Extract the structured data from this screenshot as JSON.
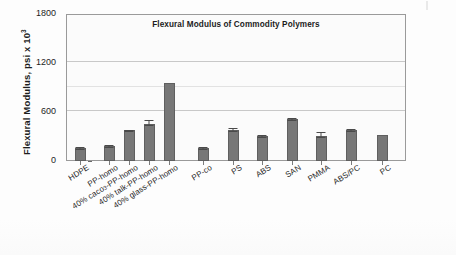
{
  "chart_data": {
    "type": "bar",
    "title": "Flexural Modulus of Commodity Polymers",
    "xlabel": "",
    "ylabel": "Flexural Modulus, psi x 10",
    "ylabel_exponent": "3",
    "ylim": [
      0,
      1800
    ],
    "yticks": [
      0,
      600,
      1200,
      1800
    ],
    "ytick_labels": [
      "0",
      "600",
      "1200",
      "1800"
    ],
    "grid": true,
    "legend": "none",
    "bar_color": "#777777",
    "bar_edge_color": "#5f5f5f",
    "plot_background": "#fbfbfb",
    "categories": [
      "HDPE",
      "PP-homo",
      "40% caco3-PP-homo",
      "40% talk-PP-homo",
      "40% glass-PP-homo",
      "PP-co",
      "PS",
      "ABS",
      "SAN",
      "PMMA",
      "ABS/PC",
      "PC"
    ],
    "category_labels_html": [
      {
        "main": "HDPE",
        "sub": "",
        "tail": ""
      },
      {
        "main": "PP-homo",
        "sub": "",
        "tail": ""
      },
      {
        "main": "40% caco",
        "sub": "3",
        "tail": "-PP-homo"
      },
      {
        "main": "40% talk-PP-homo",
        "sub": "",
        "tail": ""
      },
      {
        "main": "40% glass-PP-homo",
        "sub": "",
        "tail": ""
      },
      {
        "main": "PP-co",
        "sub": "",
        "tail": ""
      },
      {
        "main": "PS",
        "sub": "",
        "tail": ""
      },
      {
        "main": "ABS",
        "sub": "",
        "tail": ""
      },
      {
        "main": "SAN",
        "sub": "",
        "tail": ""
      },
      {
        "main": "PMMA",
        "sub": "",
        "tail": ""
      },
      {
        "main": "ABS/PC",
        "sub": "",
        "tail": ""
      },
      {
        "main": "PC",
        "sub": "",
        "tail": ""
      }
    ],
    "values": [
      165,
      185,
      375,
      450,
      960,
      155,
      385,
      310,
      520,
      310,
      380,
      320
    ],
    "errors": [
      35,
      40,
      35,
      75,
      0,
      40,
      45,
      35,
      30,
      65,
      35,
      0
    ]
  }
}
